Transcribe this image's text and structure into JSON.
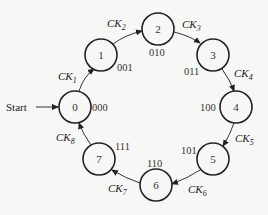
{
  "diagram": {
    "type": "state-diagram",
    "start_label": "Start",
    "states": [
      {
        "id": "0",
        "code": "000"
      },
      {
        "id": "1",
        "code": "001"
      },
      {
        "id": "2",
        "code": "010"
      },
      {
        "id": "3",
        "code": "011"
      },
      {
        "id": "4",
        "code": "100"
      },
      {
        "id": "5",
        "code": "101"
      },
      {
        "id": "6",
        "code": "110"
      },
      {
        "id": "7",
        "code": "111"
      }
    ],
    "transitions": [
      {
        "from": "0",
        "to": "1",
        "label": "CK",
        "sub": "1"
      },
      {
        "from": "1",
        "to": "2",
        "label": "CK",
        "sub": "2"
      },
      {
        "from": "2",
        "to": "3",
        "label": "CK",
        "sub": "3"
      },
      {
        "from": "3",
        "to": "4",
        "label": "CK",
        "sub": "4"
      },
      {
        "from": "4",
        "to": "5",
        "label": "CK",
        "sub": "5"
      },
      {
        "from": "5",
        "to": "6",
        "label": "CK",
        "sub": "6"
      },
      {
        "from": "6",
        "to": "7",
        "label": "CK",
        "sub": "7"
      },
      {
        "from": "7",
        "to": "0",
        "label": "CK",
        "sub": "8"
      }
    ]
  }
}
